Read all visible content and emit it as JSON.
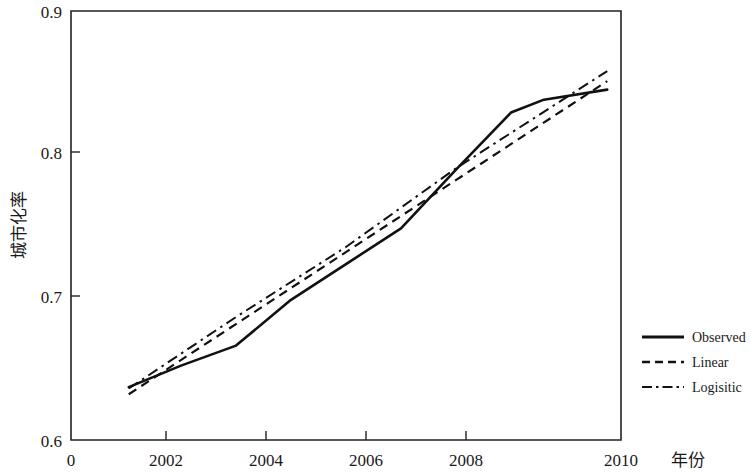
{
  "chart_data": {
    "type": "line",
    "title": "",
    "subtitle": "",
    "xlabel": "年份",
    "ylabel": "城市化率",
    "xlim": [
      2000,
      2010
    ],
    "ylim": [
      0.6,
      0.9
    ],
    "grid": false,
    "legend_position": "right-outside",
    "x_ticks": [
      "2002",
      "2004",
      "2006",
      "2008",
      "2010"
    ],
    "x_tick_values": [
      2002,
      2004,
      2006,
      2008,
      2010
    ],
    "x_origin_label": "0",
    "y_ticks": [
      "0.6",
      "0.7",
      "0.8",
      "0.9"
    ],
    "y_tick_values": [
      0.6,
      0.7,
      0.8,
      0.9
    ],
    "series": [
      {
        "name": "Observed",
        "style": "solid",
        "color": "#111111",
        "x": [
          2001.05,
          2002.0,
          2003.0,
          2004.0,
          2005.0,
          2006.0,
          2007.0,
          2008.0,
          2008.6,
          2009.75
        ],
        "values": [
          0.637,
          0.652,
          0.666,
          0.698,
          0.723,
          0.748,
          0.789,
          0.829,
          0.838,
          0.845
        ]
      },
      {
        "name": "Linear",
        "style": "dashed",
        "color": "#111111",
        "x": [
          2001.05,
          2009.75
        ],
        "values": [
          0.632,
          0.851
        ]
      },
      {
        "name": "Logisitic",
        "style": "dash-dot",
        "color": "#111111",
        "x": [
          2001.05,
          2003.0,
          2005.0,
          2007.0,
          2009.75
        ],
        "values": [
          0.636,
          0.686,
          0.735,
          0.79,
          0.858
        ]
      }
    ]
  },
  "legend": {
    "items": [
      {
        "label": "Observed",
        "style": "solid"
      },
      {
        "label": "Linear",
        "style": "dashed"
      },
      {
        "label": "Logisitic",
        "style": "dash-dot"
      }
    ]
  },
  "axes": {
    "y_title": "城市化率",
    "x_title": "年份",
    "origin_label": "0",
    "y_labels": [
      "0.9",
      "0.8",
      "0.7",
      "0.6"
    ],
    "x_labels": [
      "2002",
      "2004",
      "2006",
      "2008",
      "2010"
    ]
  },
  "colors": {
    "line": "#111111",
    "frame": "#222222",
    "background": "#ffffff",
    "text": "#1a1a1a"
  }
}
